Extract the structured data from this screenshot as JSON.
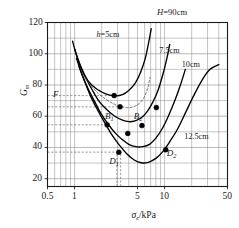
{
  "chart_data": {
    "type": "line",
    "title": "H=90cm",
    "xlabel": "σe/kPa",
    "ylabel": "Gm",
    "xscale": "log",
    "xlim": [
      0.5,
      50
    ],
    "ylim": [
      15,
      120
    ],
    "xticks": [
      0.5,
      1,
      5,
      10,
      50
    ],
    "xtick_labels": [
      "0.5",
      "1",
      "5",
      "10",
      "50"
    ],
    "yticks": [
      20,
      40,
      60,
      80,
      100,
      120
    ],
    "ytick_labels": [
      "20",
      "40",
      "60",
      "80",
      "100",
      "120"
    ],
    "grid": "log-minor-both",
    "legend_position": "inline-curve-labels",
    "series": [
      {
        "name": "h=5cm",
        "label": "h=5cm",
        "label_x": 3.0,
        "label_y": 110,
        "style": "solid",
        "points": [
          [
            0.95,
            108
          ],
          [
            1.05,
            99
          ],
          [
            1.2,
            90
          ],
          [
            1.4,
            83
          ],
          [
            1.7,
            78
          ],
          [
            2.0,
            75.5
          ],
          [
            2.4,
            73.6
          ],
          [
            2.9,
            73.0
          ],
          [
            3.4,
            73.8
          ],
          [
            4.0,
            76.5
          ],
          [
            4.7,
            81
          ],
          [
            5.4,
            88
          ],
          [
            6.1,
            97
          ],
          [
            6.7,
            108
          ],
          [
            7.1,
            116
          ]
        ]
      },
      {
        "name": "7.5cm",
        "label": "7.5cm",
        "label_x": 11.5,
        "label_y": 101,
        "style": "solid",
        "points": [
          [
            1.0,
            103
          ],
          [
            1.15,
            93
          ],
          [
            1.35,
            84
          ],
          [
            1.6,
            76
          ],
          [
            1.9,
            69
          ],
          [
            2.3,
            64
          ],
          [
            2.8,
            60
          ],
          [
            3.4,
            57.5
          ],
          [
            4.0,
            56.5
          ],
          [
            4.7,
            57.0
          ],
          [
            5.5,
            59
          ],
          [
            6.4,
            63
          ],
          [
            7.4,
            69
          ],
          [
            8.5,
            77
          ],
          [
            9.6,
            87
          ],
          [
            10.6,
            97
          ],
          [
            11.4,
            106
          ]
        ]
      },
      {
        "name": "10cm",
        "label": "10cm",
        "label_x": 19.0,
        "label_y": 92,
        "style": "solid",
        "points": [
          [
            1.05,
            97
          ],
          [
            1.2,
            87
          ],
          [
            1.4,
            78
          ],
          [
            1.65,
            70
          ],
          [
            1.95,
            62
          ],
          [
            2.35,
            55
          ],
          [
            2.85,
            49
          ],
          [
            3.4,
            45
          ],
          [
            4.0,
            42
          ],
          [
            4.8,
            40.5
          ],
          [
            5.7,
            40.5
          ],
          [
            6.8,
            42
          ],
          [
            8.0,
            46
          ],
          [
            9.4,
            52
          ],
          [
            11.0,
            60
          ],
          [
            13.0,
            70
          ],
          [
            15.0,
            80
          ],
          [
            17.0,
            90
          ]
        ]
      },
      {
        "name": "12.5cm",
        "label": "12.5cm",
        "label_x": 22.0,
        "label_y": 46,
        "style": "solid",
        "points": [
          [
            1.12,
            92
          ],
          [
            1.3,
            82
          ],
          [
            1.5,
            73
          ],
          [
            1.8,
            64
          ],
          [
            2.15,
            56
          ],
          [
            2.6,
            48
          ],
          [
            3.1,
            42
          ],
          [
            3.8,
            36
          ],
          [
            4.6,
            32
          ],
          [
            5.5,
            30.2
          ],
          [
            6.6,
            30.5
          ],
          [
            8.0,
            33
          ],
          [
            9.6,
            37.5
          ],
          [
            11.5,
            44
          ],
          [
            14.0,
            52
          ],
          [
            17.0,
            62
          ],
          [
            21.0,
            73
          ],
          [
            26.0,
            83
          ],
          [
            32.0,
            90
          ],
          [
            40.0,
            93
          ]
        ]
      },
      {
        "name": "envelope-dashed",
        "label": "",
        "style": "dashed",
        "points": [
          [
            1.25,
            86
          ],
          [
            1.5,
            80
          ],
          [
            1.8,
            75
          ],
          [
            2.2,
            71
          ],
          [
            2.7,
            68
          ],
          [
            3.2,
            66.3
          ],
          [
            3.8,
            65.5
          ],
          [
            4.5,
            66
          ],
          [
            5.2,
            68
          ],
          [
            5.9,
            72
          ],
          [
            6.5,
            78
          ],
          [
            6.9,
            85
          ]
        ]
      }
    ],
    "markers": [
      {
        "x": 2.75,
        "y": 73.2,
        "label": "",
        "label_pos": "none"
      },
      {
        "x": 3.2,
        "y": 66.0,
        "label": "",
        "label_pos": "none"
      },
      {
        "x": 2.3,
        "y": 54.5,
        "label": "B1",
        "label_pos": "above-right"
      },
      {
        "x": 3.9,
        "y": 49.0,
        "label": "",
        "label_pos": "none"
      },
      {
        "x": 5.6,
        "y": 54.0,
        "label": "B2",
        "label_pos": "above-left"
      },
      {
        "x": 8.1,
        "y": 65.5,
        "label": "",
        "label_pos": "none"
      },
      {
        "x": 3.1,
        "y": 37.0,
        "label": "D1",
        "label_pos": "below-left"
      },
      {
        "x": 10.3,
        "y": 38.5,
        "label": "D2",
        "label_pos": "right"
      }
    ],
    "annotations": [
      {
        "text": "F",
        "x": 0.62,
        "y": 73.5,
        "style": "italic"
      },
      {
        "text": "B1",
        "x": 2.45,
        "y": 59.5,
        "style": "italic-sub"
      },
      {
        "text": "B2",
        "x": 5.1,
        "y": 59.5,
        "style": "italic-sub"
      },
      {
        "text": "D1",
        "x": 2.75,
        "y": 30.5,
        "style": "italic-sub"
      },
      {
        "text": "D2",
        "x": 12.0,
        "y": 35.5,
        "style": "italic-sub"
      }
    ],
    "guide_lines": [
      {
        "type": "horizontal",
        "y": 73.2,
        "from_x": 0.5,
        "to_x": 2.75,
        "style": "dashed"
      },
      {
        "type": "horizontal",
        "y": 66.0,
        "from_x": 0.5,
        "to_x": 3.2,
        "style": "dashed"
      },
      {
        "type": "horizontal",
        "y": 54.5,
        "from_x": 0.5,
        "to_x": 2.3,
        "style": "dashed"
      },
      {
        "type": "horizontal",
        "y": 37.0,
        "from_x": 0.5,
        "to_x": 3.1,
        "style": "dashed"
      },
      {
        "type": "vertical",
        "x": 2.95,
        "from_y": 15,
        "to_y": 37.5,
        "style": "dashed"
      },
      {
        "type": "vertical",
        "x": 3.25,
        "from_y": 15,
        "to_y": 37.5,
        "style": "dashed"
      }
    ]
  },
  "labels": {
    "title": "H=90cm",
    "title_italic_part": "H",
    "title_rest": "=90cm",
    "ylabel_main": "G",
    "ylabel_sub": "m",
    "xlabel_main": "σ",
    "xlabel_sub": "e",
    "xlabel_rest": "/kPa",
    "curve1": "h=5cm",
    "curve1_italic": "h",
    "curve1_rest": "=5cm",
    "curve2": "7.5cm",
    "curve3": "10cm",
    "curve4": "12.5cm",
    "pt_F": "F",
    "pt_B1_main": "B",
    "pt_B1_sub": "1",
    "pt_B2_main": "B",
    "pt_B2_sub": "2",
    "pt_D1_main": "D",
    "pt_D1_sub": "1",
    "pt_D2_main": "D",
    "pt_D2_sub": "2",
    "tick_x_1": "0.5",
    "tick_x_2": "1",
    "tick_x_3": "5",
    "tick_x_4": "10",
    "tick_x_5": "50",
    "tick_y_1": "20",
    "tick_y_2": "40",
    "tick_y_3": "60",
    "tick_y_4": "80",
    "tick_y_5": "100",
    "tick_y_6": "120"
  },
  "colors": {
    "axis": "#1a1a1a",
    "grid": "#8a8a8a",
    "curve": "#000000",
    "marker": "#000000",
    "dashed_guide": "#555555",
    "background": "#ffffff"
  }
}
